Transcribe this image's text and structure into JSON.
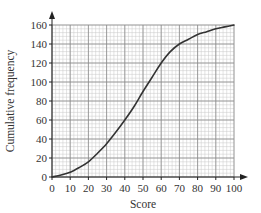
{
  "chart_data": {
    "type": "line",
    "title": "",
    "xlabel": "Score",
    "ylabel": "Cumulative frequency",
    "xlim": [
      0,
      100
    ],
    "ylim": [
      0,
      160
    ],
    "x_ticks": [
      0,
      10,
      20,
      30,
      40,
      50,
      60,
      70,
      80,
      90,
      100
    ],
    "y_ticks": [
      0,
      20,
      40,
      60,
      80,
      100,
      120,
      140,
      160
    ],
    "grid": true,
    "grid_minor_divisions": 5,
    "legend": null,
    "series": [
      {
        "name": "Cumulative frequency",
        "color": "#333333",
        "x": [
          0,
          5,
          10,
          15,
          20,
          25,
          30,
          35,
          40,
          45,
          50,
          55,
          60,
          65,
          70,
          75,
          80,
          85,
          90,
          95,
          100
        ],
        "y": [
          0,
          2,
          5,
          10,
          16,
          25,
          35,
          47,
          60,
          74,
          90,
          105,
          120,
          132,
          140,
          145,
          150,
          153,
          156,
          158,
          160
        ]
      }
    ]
  }
}
